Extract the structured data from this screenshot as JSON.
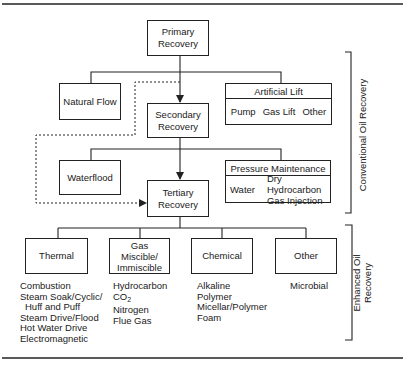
{
  "diagram": {
    "nodes": {
      "primary": "Primary\nRecovery",
      "primary_l1": "Primary",
      "primary_l2": "Recovery",
      "natural_flow": "Natural Flow",
      "artificial_lift": {
        "header": "Artificial Lift",
        "items": [
          "Pump",
          "Gas Lift",
          "Other"
        ]
      },
      "secondary_l1": "Secondary",
      "secondary_l2": "Recovery",
      "waterflood": "Waterflood",
      "pressure_maintenance": {
        "header": "Pressure Maintenance",
        "items": [
          "Water",
          "Dry Hydrocarbon",
          "Gas Injection"
        ]
      },
      "tertiary_l1": "Tertiary",
      "tertiary_l2": "Recovery",
      "thermal": "Thermal",
      "gas_l1": "Gas",
      "gas_l2": "Miscible/",
      "gas_l3": "Immiscible",
      "chemical": "Chemical",
      "other": "Other"
    },
    "lists": {
      "thermal": [
        "Combustion",
        "Steam Soak/Cyclic/",
        "Huff and Puff",
        "Steam Drive/Flood",
        "Hot Water Drive",
        "Electromagnetic"
      ],
      "gas": [
        "Hydrocarbon",
        "CO",
        "2",
        "Nitrogen",
        "Flue Gas"
      ],
      "chemical": [
        "Alkaline",
        "Polymer",
        "Micellar/Polymer",
        "Foam"
      ],
      "other": [
        "Microbial"
      ]
    },
    "brackets": {
      "conventional": "Conventional Oil Recovery",
      "enhanced_l1": "Enhanced Oil",
      "enhanced_l2": "Recovery"
    },
    "colors": {
      "line": "#222222",
      "background": "#ffffff"
    }
  }
}
